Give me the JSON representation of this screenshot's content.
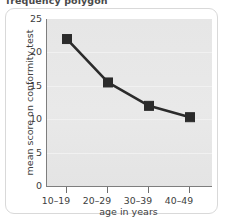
{
  "caption": "frequency polygon",
  "chart_data": {
    "type": "line",
    "title": "",
    "xlabel": "age in years",
    "ylabel": "mean score on conformity test",
    "categories": [
      "10–19",
      "20–29",
      "30–39",
      "40–49"
    ],
    "values": [
      22,
      15.5,
      12,
      10.3
    ],
    "ylim": [
      0,
      25
    ],
    "yticks": [
      0,
      5,
      10,
      15,
      20,
      25
    ],
    "ytick_labels": [
      "0",
      "5",
      "10",
      "15",
      "20",
      "25"
    ],
    "grid": true,
    "legend": "none",
    "marker": "square",
    "series_color": "#2b2b2b",
    "plot_background": "#e7e7e7",
    "axis_color": "#7e7e7e"
  }
}
